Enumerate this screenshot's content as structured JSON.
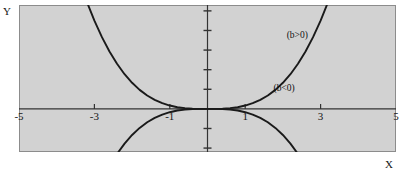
{
  "figure": {
    "background_color": "#ffffff",
    "panel_color": "#d2d2d2",
    "panel_border_color": "#8c8c8c",
    "axis_color": "#333333",
    "curve_color": "#1a1a1a"
  },
  "axes": {
    "x_name": "X",
    "y_name": "Y"
  },
  "chart_data": {
    "type": "line",
    "title": "",
    "xlabel": "X",
    "ylabel": "Y",
    "xlim": [
      -5,
      5
    ],
    "ylim": [
      -2.2,
      5.3
    ],
    "grid": false,
    "legend_position": "inline-annotation",
    "x_ticks": [
      -5,
      -3,
      -1,
      1,
      3,
      5
    ],
    "x_tick_labels": [
      "-5",
      "-3",
      "-1",
      "1",
      "3",
      "5"
    ],
    "y_ticks": [
      -2,
      -1,
      1,
      2,
      3,
      4,
      5
    ],
    "y_tick_labels": [
      "",
      "",
      "",
      "",
      "",
      "",
      ""
    ],
    "annotations": [
      {
        "text": "(b>0)",
        "x": 2.1,
        "y": 3.6
      },
      {
        "text": "(b<0)",
        "x": 1.75,
        "y": 0.9
      }
    ],
    "series": [
      {
        "name": "(b>0)",
        "label": "(b>0)",
        "equation": "y = b*x^3, b > 0",
        "x": [
          -3.2,
          -3.0,
          -2.8,
          -2.6,
          -2.4,
          -2.2,
          -2.0,
          -1.8,
          -1.6,
          -1.4,
          -1.2,
          -1.0,
          -0.8,
          -0.6,
          -0.4,
          -0.2,
          0.0,
          0.2,
          0.4,
          0.6,
          0.8,
          1.0,
          1.2,
          1.4,
          1.6,
          1.8,
          2.0,
          2.2,
          2.4,
          2.6,
          2.8,
          3.0,
          3.2
        ],
        "y": [
          5.46,
          4.5,
          3.66,
          2.93,
          2.3,
          1.77,
          1.33,
          0.97,
          0.68,
          0.46,
          0.29,
          0.17,
          0.085,
          0.036,
          0.011,
          0.001,
          0.0,
          -0.001,
          -0.011,
          -0.036,
          -0.085,
          -0.17,
          -0.29,
          -0.46,
          -0.68,
          -0.97,
          -1.33,
          -1.77,
          -2.3,
          -2.93,
          -3.66,
          -4.5,
          -5.46
        ],
        "note": "branch entering top-left, descending through origin to bottom-right"
      },
      {
        "name": "(b<0)",
        "label": "(b<0)",
        "equation": "y = b*x^3, b < 0",
        "x": [
          -3.2,
          -3.0,
          -2.8,
          -2.6,
          -2.4,
          -2.2,
          -2.0,
          -1.8,
          -1.6,
          -1.4,
          -1.2,
          -1.0,
          -0.8,
          -0.6,
          -0.4,
          -0.2,
          0.0,
          0.2,
          0.4,
          0.6,
          0.8,
          1.0,
          1.2,
          1.4,
          1.6,
          1.8,
          2.0,
          2.2,
          2.4,
          2.6,
          2.8,
          3.0,
          3.2
        ],
        "y": [
          -5.46,
          -4.5,
          -3.66,
          -2.93,
          -2.3,
          -1.77,
          -1.33,
          -0.97,
          -0.68,
          -0.46,
          -0.29,
          -0.17,
          -0.085,
          -0.036,
          -0.011,
          -0.001,
          0.0,
          0.001,
          0.011,
          0.036,
          0.085,
          0.17,
          0.29,
          0.46,
          0.68,
          0.97,
          1.33,
          1.77,
          2.3,
          2.93,
          3.66,
          4.5,
          5.46
        ],
        "note": "branch entering bottom-left, rising through origin to top-right"
      }
    ]
  }
}
